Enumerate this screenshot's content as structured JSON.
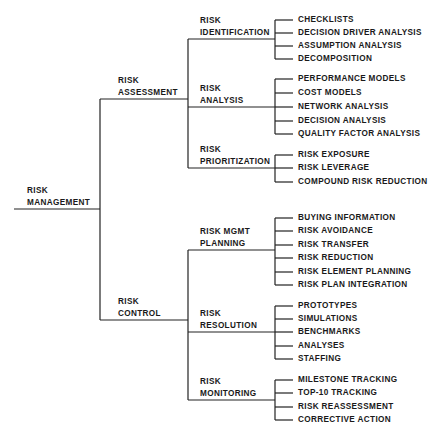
{
  "root": {
    "line1": "RISK",
    "line2": "MANAGEMENT"
  },
  "branches": [
    {
      "line1": "RISK",
      "line2": "ASSESSMENT",
      "children": [
        {
          "line1": "RISK",
          "line2": "IDENTIFICATION",
          "leaves": [
            "CHECKLISTS",
            "DECISION DRIVER ANALYSIS",
            "ASSUMPTION ANALYSIS",
            "DECOMPOSITION"
          ]
        },
        {
          "line1": "RISK",
          "line2": "ANALYSIS",
          "leaves": [
            "PERFORMANCE MODELS",
            "COST MODELS",
            "NETWORK ANALYSIS",
            "DECISION ANALYSIS",
            "QUALITY FACTOR ANALYSIS"
          ]
        },
        {
          "line1": "RISK",
          "line2": "PRIORITIZATION",
          "leaves": [
            "RISK EXPOSURE",
            "RISK LEVERAGE",
            "COMPOUND RISK REDUCTION"
          ]
        }
      ]
    },
    {
      "line1": "RISK",
      "line2": "CONTROL",
      "children": [
        {
          "line1": "RISK MGMT",
          "line2": "PLANNING",
          "leaves": [
            "BUYING INFORMATION",
            "RISK AVOIDANCE",
            "RISK TRANSFER",
            "RISK REDUCTION",
            "RISK ELEMENT PLANNING",
            "RISK PLAN INTEGRATION"
          ]
        },
        {
          "line1": "RISK",
          "line2": "RESOLUTION",
          "leaves": [
            "PROTOTYPES",
            "SIMULATIONS",
            "BENCHMARKS",
            "ANALYSES",
            "STAFFING"
          ]
        },
        {
          "line1": "RISK",
          "line2": "MONITORING",
          "leaves": [
            "MILESTONE TRACKING",
            "TOP-10 TRACKING",
            "RISK REASSESSMENT",
            "CORRECTIVE ACTION"
          ]
        }
      ]
    }
  ],
  "colors": {
    "line": "#222222",
    "text": "#1a1a1a",
    "background": "#ffffff"
  }
}
